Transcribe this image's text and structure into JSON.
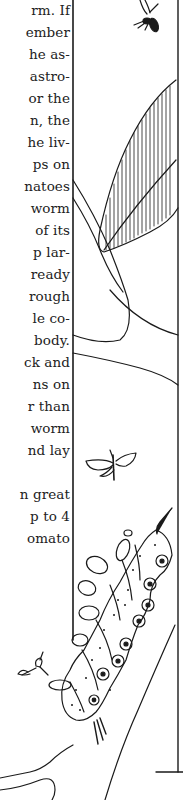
{
  "page": {
    "type": "book-page-fragment",
    "text_lines": [
      "rm. If",
      "ember",
      "he as-",
      "astro-",
      "or the",
      "n, the",
      "he liv-",
      "ps on",
      "natoes",
      "worm",
      "of its",
      "p lar-",
      "ready",
      "rough",
      "le co-",
      "body.",
      "ck and",
      "ns on",
      "r than",
      "worm",
      "nd lay",
      "",
      "n great",
      "p to 4",
      "omato"
    ],
    "text_line_tops": [
      2,
      24,
      46,
      68,
      90,
      112,
      134,
      156,
      178,
      200,
      222,
      244,
      266,
      288,
      310,
      332,
      354,
      376,
      398,
      420,
      442,
      464,
      486,
      508,
      530
    ],
    "illustration": {
      "description": "Pen-and-ink drawing in a tall rectangular frame: wasp at top, hatched tomato leaf on branch, small moth, and a spotted hornworm caterpillar with eye-spots climbing a stem, with a small parasitic wasp near it.",
      "elements": [
        "wasp-icon",
        "leaf-icon",
        "branch",
        "moth-icon",
        "caterpillar-icon",
        "small-wasp-icon"
      ],
      "stroke_color": "#1a1a1a",
      "background": "#ffffff"
    }
  }
}
